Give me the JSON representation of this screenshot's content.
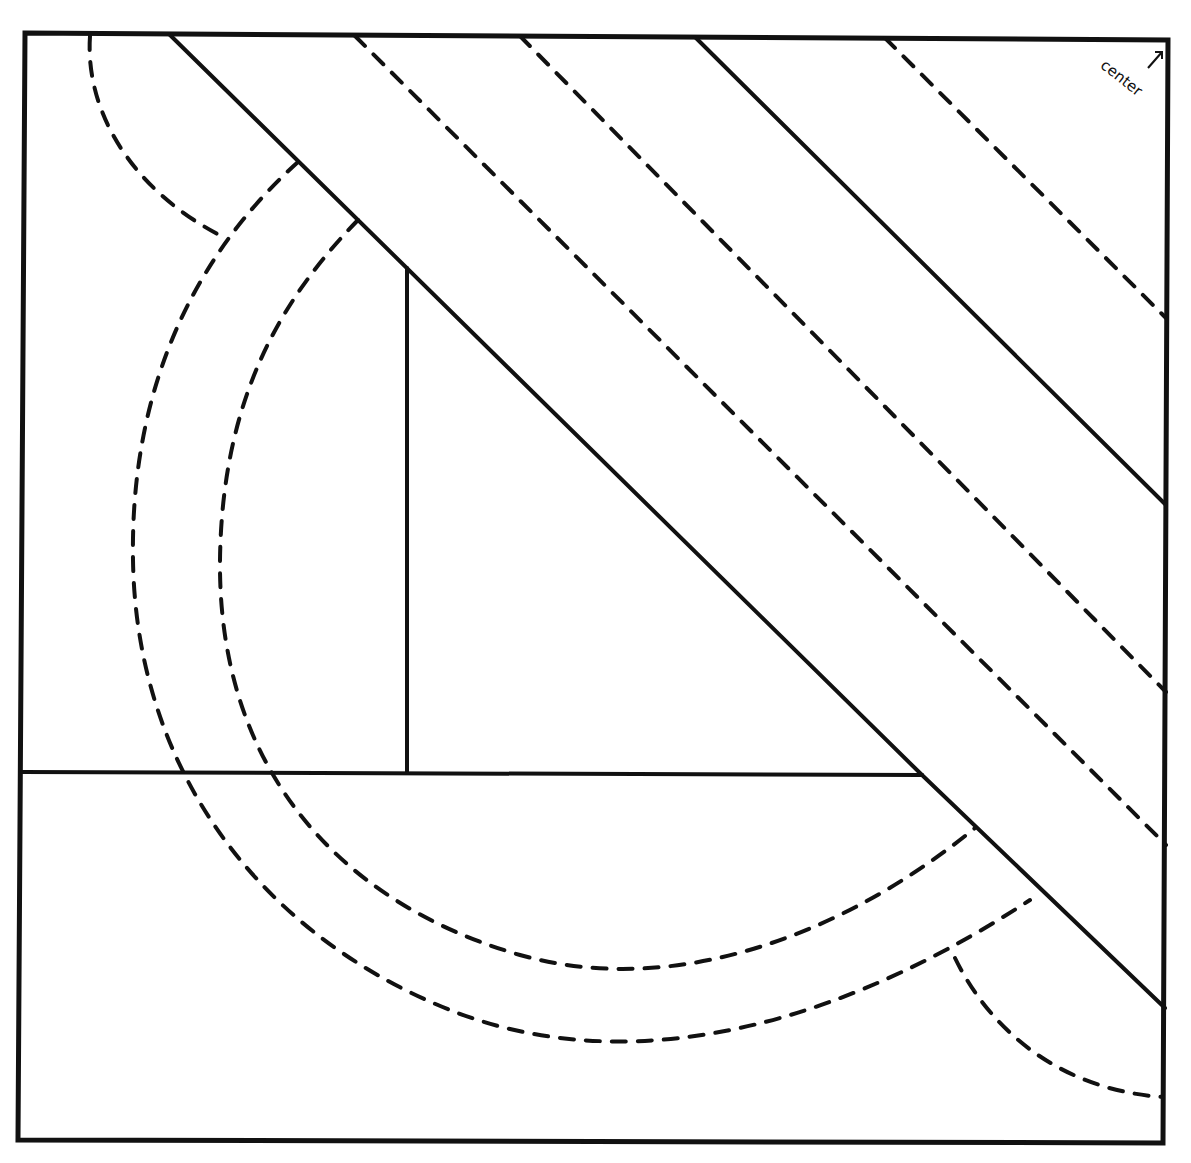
{
  "diagram": {
    "type": "quilt-block-pattern",
    "colors": {
      "stroke": "#111111",
      "background": "#ffffff"
    },
    "frame": {
      "points": [
        [
          25,
          33
        ],
        [
          1168,
          40
        ],
        [
          1163,
          1143
        ],
        [
          18,
          1140
        ]
      ]
    },
    "solid_lines": [
      {
        "name": "diagonal-seam-left",
        "from": [
          170,
          35
        ],
        "to": [
          922,
          775
        ]
      },
      {
        "name": "diagonal-seam-lower",
        "from": [
          922,
          775
        ],
        "to": [
          1165,
          1008
        ]
      },
      {
        "name": "diagonal-seam-right",
        "from": [
          695,
          37
        ],
        "to": [
          1166,
          505
        ]
      },
      {
        "name": "vertical-seam",
        "from": [
          407,
          268
        ],
        "to": [
          407,
          773
        ]
      },
      {
        "name": "horizontal-seam",
        "from": [
          22,
          772
        ],
        "to": [
          922,
          775
        ]
      }
    ],
    "dashed_lines": [
      {
        "name": "quilting-line-1",
        "from": [
          355,
          36
        ],
        "to": [
          1166,
          845
        ]
      },
      {
        "name": "quilting-line-2",
        "from": [
          520,
          36
        ],
        "to": [
          1166,
          692
        ]
      },
      {
        "name": "quilting-line-3",
        "from": [
          885,
          38
        ],
        "to": [
          1166,
          318
        ]
      }
    ],
    "dashed_curves": [
      {
        "name": "corner-arc-top-left",
        "d": "M 90 36 C 85 110, 130 190, 225 238"
      },
      {
        "name": "outer-arc",
        "d": "M 298 162 C 200 250, 130 380, 133 560 C 136 760, 250 930, 450 1010 C 600 1070, 800 1050, 1030 900"
      },
      {
        "name": "inner-arc",
        "d": "M 358 220 C 280 300, 222 400, 220 560 C 218 760, 330 900, 520 955 C 680 1000, 850 930, 975 828"
      },
      {
        "name": "corner-arc-bottom-right",
        "d": "M 955 958 C 990 1030, 1060 1090, 1163 1097"
      }
    ],
    "label": {
      "text": "center",
      "arrow": "↑",
      "x": 1108,
      "y": 56,
      "rotate": 38
    }
  }
}
